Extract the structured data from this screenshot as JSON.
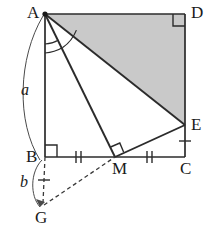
{
  "figure": {
    "background_color": "#ffffff",
    "stroke_color": "#2b2b2b",
    "shade_color": "#c9c9c9",
    "width": 215,
    "height": 230
  },
  "vertices": {
    "A": {
      "label": "A",
      "x": 45,
      "y": 14
    },
    "B": {
      "label": "B",
      "x": 45,
      "y": 157
    },
    "C": {
      "label": "C",
      "x": 185,
      "y": 157
    },
    "D": {
      "label": "D",
      "x": 185,
      "y": 14
    },
    "E": {
      "label": "E",
      "x": 185,
      "y": 125
    },
    "M": {
      "label": "M",
      "x": 115,
      "y": 157
    },
    "G": {
      "label": "G",
      "x": 42,
      "y": 210
    }
  },
  "labels": {
    "A": "A",
    "B": "B",
    "C": "C",
    "D": "D",
    "E": "E",
    "M": "M",
    "G": "G",
    "side_a": "a",
    "side_b": "b"
  },
  "segments": [
    {
      "name": "AD",
      "from": "A",
      "to": "D",
      "style": "solid"
    },
    {
      "name": "DC",
      "from": "D",
      "to": "C",
      "style": "solid"
    },
    {
      "name": "BC",
      "from": "B",
      "to": "C",
      "style": "solid"
    },
    {
      "name": "AB",
      "from": "A",
      "to": "B",
      "style": "solid"
    },
    {
      "name": "AE",
      "from": "A",
      "to": "E",
      "style": "solid"
    },
    {
      "name": "AM",
      "from": "A",
      "to": "M",
      "style": "solid"
    },
    {
      "name": "ME",
      "from": "M",
      "to": "E",
      "style": "solid"
    },
    {
      "name": "BG",
      "from": "B",
      "to": "G",
      "style": "dashed"
    },
    {
      "name": "GM",
      "from": "G",
      "to": "M",
      "style": "dashed"
    }
  ],
  "shaded_region": {
    "name": "triangle-ADE",
    "vertices": [
      "A",
      "D",
      "E"
    ],
    "fill": "#c9c9c9"
  },
  "right_angles": [
    {
      "name": "right-angle-D",
      "at": "D"
    },
    {
      "name": "right-angle-B",
      "at": "B"
    },
    {
      "name": "right-angle-M",
      "at": "M"
    }
  ],
  "tick_marks": [
    {
      "name": "tick-BM",
      "segment": "BM",
      "count": 2
    },
    {
      "name": "tick-MC",
      "segment": "MC",
      "count": 2
    },
    {
      "name": "tick-EC",
      "segment": "EC",
      "count": 1
    },
    {
      "name": "tick-BG",
      "segment": "BG",
      "count": 1
    }
  ],
  "angle_arcs": [
    {
      "name": "angle-BAM",
      "at": "A",
      "between": [
        "AB",
        "AM"
      ]
    },
    {
      "name": "angle-MAE",
      "at": "A",
      "between": [
        "AM",
        "AE"
      ]
    }
  ],
  "measure_arcs": [
    {
      "name": "measure-arc-a",
      "label": "a",
      "from": "A",
      "to": "B"
    },
    {
      "name": "measure-arc-b",
      "label": "b",
      "from": "B",
      "to": "G"
    }
  ]
}
